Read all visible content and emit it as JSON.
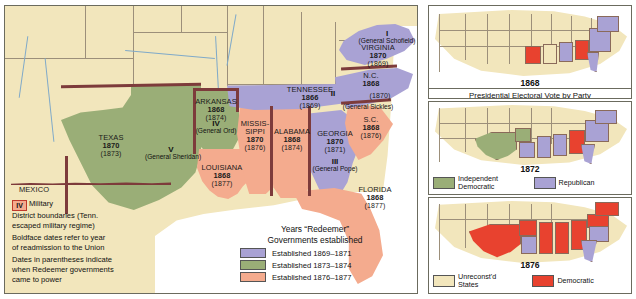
{
  "map": {
    "title": "Reconstruction of the South",
    "mexico_label": "MEXICO",
    "states": [
      {
        "name": "TEXAS",
        "year": "1870",
        "redeemer": "(1873)"
      },
      {
        "name": "ARKANSAS",
        "year": "1868",
        "redeemer": "(1874)"
      },
      {
        "name": "LOUISIANA",
        "year": "1868",
        "redeemer": "(1877)"
      },
      {
        "name": "MISSIS-",
        "name2": "SIPPI",
        "year": "1870",
        "redeemer": "(1876)"
      },
      {
        "name": "ALABAMA",
        "year": "1868",
        "redeemer": "(1874)"
      },
      {
        "name": "TENNESSEE",
        "year": "1866",
        "redeemer": "(1869)"
      },
      {
        "name": "GEORGIA",
        "year": "1870",
        "redeemer": "(1871)"
      },
      {
        "name": "FLORIDA",
        "year": "1868",
        "redeemer": "(1877)"
      },
      {
        "name": "S.C.",
        "year": "1868",
        "redeemer": "(1876)"
      },
      {
        "name": "N.C.",
        "year": "1868",
        "redeemer": "(1870)"
      },
      {
        "name": "VIRGINIA",
        "year": "1870",
        "redeemer": "(1869)"
      }
    ],
    "districts": [
      {
        "numeral": "I",
        "general": "(General Schofield)"
      },
      {
        "numeral": "II",
        "general": "(General Sickles)"
      },
      {
        "numeral": "III",
        "general": "(General Pope)"
      },
      {
        "numeral": "IV",
        "general": "(General Ord)"
      },
      {
        "numeral": "V",
        "general": "(General Sheridan)"
      }
    ],
    "notes": {
      "swatch_numeral": "IV",
      "line1": "Military",
      "line2": "District boundaries (Tenn.",
      "line3": "escaped military regime)",
      "line4": "Boldface dates refer to year",
      "line5": "of readmission to the Union",
      "line6": "Dates in parentheses indicate",
      "line7": "when Redeemer governments",
      "line8": "came to power"
    },
    "legend": {
      "title_line1": "Years “Redeemer”",
      "title_line2": "Governments established",
      "items": [
        {
          "label": "Established 1869–1871",
          "color": "#a9a2d4"
        },
        {
          "label": "Established 1873–1874",
          "color": "#9aae77"
        },
        {
          "label": "Established 1876–1877",
          "color": "#f4ab8e"
        }
      ]
    }
  },
  "side_panels": {
    "caption": "Presidential Electoral Vote by Party",
    "panels": [
      {
        "year": "1868",
        "legend": []
      },
      {
        "year": "1872",
        "legend": [
          {
            "label_line1": "Independent",
            "label_line2": "Democratic",
            "color": "#9aae77"
          },
          {
            "label_line1": "Republican",
            "label_line2": "",
            "color": "#a9a2d4"
          }
        ]
      },
      {
        "year": "1876",
        "legend": [
          {
            "label_line1": "Unreconst'd",
            "label_line2": "States",
            "color": "#f2e6bc"
          },
          {
            "label_line1": "Democratic",
            "label_line2": "",
            "color": "#e8422f"
          }
        ]
      }
    ]
  },
  "colors": {
    "land_cream": "#f2e6bc",
    "purple": "#a9a2d4",
    "olive": "#9aae77",
    "salmon": "#f4ab8e",
    "red": "#e8422f",
    "district_boundary": "#7d3b3b",
    "water": "#7fa9c9"
  }
}
